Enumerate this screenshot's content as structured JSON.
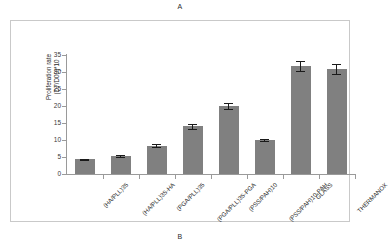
{
  "figure": {
    "panel_letter_top": "A",
    "panel_letter_bottom": "B"
  },
  "colors": {
    "bar_fill": "#808080",
    "error_bar": "#1a1a1a",
    "axis_line": "#9a9a9a",
    "frame_border": "#c9c9c9",
    "text": "#2b2b2b"
  },
  "chart_data": {
    "type": "bar",
    "title": "",
    "xlabel": "",
    "ylabel": "Proliferation rate\n(D7/D00)*10",
    "ylim": [
      0,
      35
    ],
    "yticks": [
      0,
      5,
      10,
      15,
      20,
      25,
      30,
      35
    ],
    "ytick_labels": [
      "0",
      "5",
      "10",
      "15",
      "20",
      "25",
      "30",
      "35"
    ],
    "grid": false,
    "legend": null,
    "categories": [
      "(HA/PLL)35",
      "(HA/PLL)35-HA",
      "(PGA/PLL)35",
      "(PGA/PLL)35-PGA",
      "(PSS/PAH)10",
      "(PSS/PAH)10-PAH",
      "GLASS",
      "THERMANOX"
    ],
    "values": [
      4.3,
      5.2,
      8.3,
      14.0,
      20.0,
      10.0,
      31.8,
      31.0
    ],
    "errors": [
      0.25,
      0.3,
      0.45,
      0.7,
      0.9,
      0.35,
      1.4,
      1.5
    ]
  }
}
